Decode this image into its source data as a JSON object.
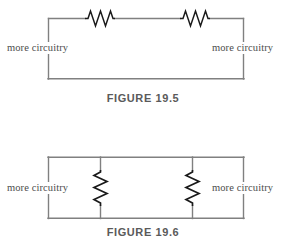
{
  "page": {
    "background_color": "#ffffff",
    "line_color": "#808080",
    "resistor_color": "#1a1a1a",
    "text_color": "#4c4c4c"
  },
  "figures": [
    {
      "id": "figure-19-5",
      "caption": "FIGURE  19.5",
      "topology": "series",
      "left_label": "more circuitry",
      "right_label": "more circuitry",
      "resistor_count": 2,
      "resistor_orientation": "horizontal"
    },
    {
      "id": "figure-19-6",
      "caption": "FIGURE  19.6",
      "topology": "parallel",
      "left_label": "more circuitry",
      "right_label": "more circuitry",
      "resistor_count": 2,
      "resistor_orientation": "vertical"
    }
  ]
}
